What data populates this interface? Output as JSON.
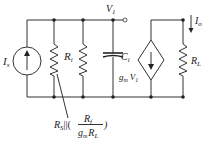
{
  "diagram": {
    "type": "small-signal equivalent circuit",
    "labels": {
      "source_current": {
        "main": "I",
        "sub": "s"
      },
      "input_resistance": {
        "main": "R",
        "sub": "i"
      },
      "node_voltage": {
        "main": "V",
        "sub": "1"
      },
      "input_capacitance": {
        "main": "C",
        "sub": "i"
      },
      "dependent_source": {
        "gm": "g",
        "gm_sub": "m",
        "v": "V",
        "v_sub": "1"
      },
      "load_resistor": {
        "main": "R",
        "sub": "L"
      },
      "output_current": {
        "main": "I",
        "sub": "o"
      },
      "equivalent": {
        "rs": "R",
        "rs_sub": "S",
        "parallel": "||(",
        "num": "R",
        "num_sub": "f",
        "den_g": "g",
        "den_g_sub": "m",
        "den_r": "R",
        "den_r_sub": "L",
        "close": ")"
      }
    },
    "components": [
      "independent current source Is (arrow up)",
      "resistor Rs||(Rf/gmRL)",
      "resistor Ri",
      "capacitor Ci",
      "voltage-controlled current source gmV1 (arrow down)",
      "load resistor RL"
    ],
    "colors": {
      "line": "#333333",
      "background": "#ffffff"
    }
  }
}
